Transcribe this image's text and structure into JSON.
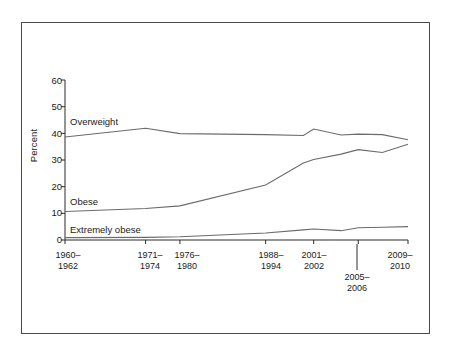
{
  "figure": {
    "name": "obesity-trends-line-chart",
    "background_color": "#ffffff",
    "frame_color": "#4a4a4a",
    "line_color": "#6b6b6b",
    "axis_color": "#2a2a2a"
  },
  "chart_data": {
    "type": "line",
    "title": "",
    "subtitle": "",
    "xlabel": "",
    "ylabel": "Percent",
    "ylim": [
      0,
      60
    ],
    "yticks": [
      0,
      10,
      20,
      30,
      40,
      50,
      60
    ],
    "grid": false,
    "legend_position": "inline-labels",
    "categories": [
      "1960–1962",
      "1971–1974",
      "1976–1980",
      "1988–1994",
      "1999–2000",
      "2001–2002",
      "2003–2004",
      "2005–2006",
      "2007–2008",
      "2009–2010"
    ],
    "xtick_labels": [
      {
        "line1": "1960–",
        "line2": "1962"
      },
      {
        "line1": "1971–",
        "line2": "1974"
      },
      {
        "line1": "1976–",
        "line2": "1980"
      },
      {
        "line1": "1988–",
        "line2": "1994"
      },
      {
        "line1": "2001–",
        "line2": "2002"
      },
      {
        "line1": "2005–",
        "line2": "2006"
      },
      {
        "line1": "2009–",
        "line2": "2010"
      }
    ],
    "series": [
      {
        "name": "Overweight",
        "label": "Overweight",
        "values": [
          38.6,
          41.9,
          39.9,
          39.5,
          39.2,
          41.6,
          39.4,
          39.7,
          39.5,
          37.6
        ]
      },
      {
        "name": "Obese",
        "label": "Obese",
        "values": [
          10.7,
          11.8,
          12.8,
          20.6,
          28.9,
          30.2,
          32.2,
          33.9,
          32.8,
          35.9
        ]
      },
      {
        "name": "Extremely obese",
        "label": "Extremely obese",
        "values": [
          0.9,
          1.0,
          1.2,
          2.6,
          3.8,
          4.1,
          3.5,
          4.6,
          4.8,
          5.0
        ]
      }
    ],
    "annotations": [
      {
        "text": "Overweight",
        "series": "Overweight"
      },
      {
        "text": "Obese",
        "series": "Obese"
      },
      {
        "text": "Extremely obese",
        "series": "Extremely obese"
      }
    ]
  }
}
